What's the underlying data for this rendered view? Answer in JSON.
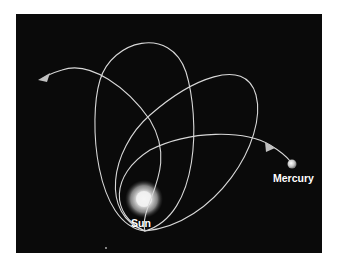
{
  "diagram": {
    "background_color": "#0a0a0a",
    "orbit_color": "#d8d8d8",
    "bodies": [
      {
        "name": "Sun",
        "label": "Sun"
      },
      {
        "name": "Mercury",
        "label": "Mercury"
      }
    ],
    "orbit_count": 3,
    "arrows": [
      {
        "name": "direction-arrow-incoming",
        "description": "arrow along Mercury's path heading toward the orbit"
      },
      {
        "name": "direction-arrow-outgoing",
        "description": "arrow at the end of the precessed path pointing left"
      }
    ]
  }
}
